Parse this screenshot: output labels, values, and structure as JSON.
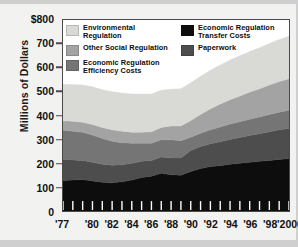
{
  "chart_data": {
    "type": "area",
    "stacked": true,
    "title": "",
    "xlabel": "",
    "ylabel": "Millions of Dollars",
    "ylim": [
      0,
      800
    ],
    "ytick_labels": [
      "$800",
      "700",
      "600",
      "500",
      "400",
      "300",
      "200",
      "100",
      "0"
    ],
    "ytick_values": [
      800,
      700,
      600,
      500,
      400,
      300,
      200,
      100,
      0
    ],
    "xlim": [
      1977,
      2000
    ],
    "x": [
      1977,
      1978,
      1979,
      1980,
      1981,
      1982,
      1983,
      1984,
      1985,
      1986,
      1987,
      1988,
      1989,
      1990,
      1991,
      1992,
      1993,
      1994,
      1995,
      1996,
      1997,
      1998,
      1999,
      2000
    ],
    "xtick_labels": [
      "'77",
      "'80",
      "'82",
      "'84",
      "'86",
      "'88",
      "'90",
      "'92",
      "'94",
      "'96",
      "'98",
      "'2000"
    ],
    "xtick_years": [
      1977,
      1980,
      1982,
      1984,
      1986,
      1988,
      1990,
      1992,
      1994,
      1996,
      1998,
      2000
    ],
    "grid": false,
    "legend_position": "inside-top",
    "series": [
      {
        "name": "Economic Regulation Transfer Costs",
        "color": "#0d0d0d",
        "order": 1,
        "values": [
          128,
          130,
          132,
          126,
          120,
          118,
          122,
          130,
          140,
          146,
          158,
          152,
          150,
          165,
          178,
          186,
          190,
          196,
          200,
          204,
          208,
          212,
          216,
          220
        ]
      },
      {
        "name": "Paperwork",
        "color": "#4d4d4d",
        "order": 2,
        "values": [
          88,
          84,
          80,
          78,
          76,
          74,
          72,
          70,
          68,
          66,
          68,
          70,
          72,
          88,
          92,
          96,
          100,
          104,
          108,
          112,
          116,
          120,
          124,
          126
        ]
      },
      {
        "name": "Economic Regulation Efficiency Costs",
        "color": "#757575",
        "order": 3,
        "values": [
          122,
          120,
          118,
          114,
          108,
          100,
          92,
          84,
          76,
          72,
          72,
          76,
          72,
          56,
          56,
          58,
          62,
          64,
          66,
          68,
          70,
          72,
          74,
          76
        ]
      },
      {
        "name": "Other Social Regulation",
        "color": "#a3a3a3",
        "order": 4,
        "values": [
          40,
          42,
          42,
          44,
          46,
          48,
          48,
          46,
          46,
          48,
          52,
          58,
          62,
          70,
          78,
          88,
          96,
          102,
          108,
          114,
          118,
          124,
          128,
          132
        ]
      },
      {
        "name": "Environmental Regulation",
        "color": "#d9d9d6",
        "order": 5,
        "values": [
          152,
          154,
          156,
          158,
          158,
          160,
          160,
          160,
          160,
          158,
          156,
          154,
          156,
          158,
          160,
          162,
          164,
          166,
          168,
          170,
          172,
          174,
          176,
          178
        ]
      }
    ],
    "legend": [
      {
        "label": "Environmental Regulation",
        "color": "#d9d9d6",
        "column": 1
      },
      {
        "label": "Other Social Regulation",
        "color": "#a3a3a3",
        "column": 1
      },
      {
        "label": "Economic Regulation Efficiency Costs",
        "color": "#757575",
        "column": 1
      },
      {
        "label": "Economic Regulation Transfer Costs",
        "color": "#0d0d0d",
        "column": 2
      },
      {
        "label": "Paperwork",
        "color": "#4d4d4d",
        "column": 2
      }
    ]
  }
}
